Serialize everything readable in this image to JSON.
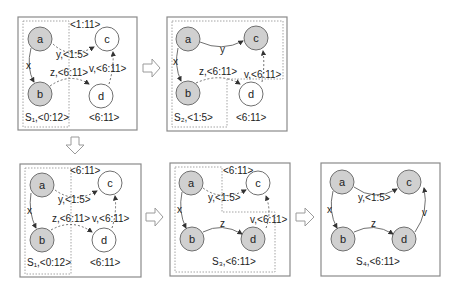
{
  "panels": [
    {
      "id": "p1",
      "set_label": "S₁,<0:12>",
      "nodes": {
        "a": "a",
        "b": "b",
        "c": "c",
        "d": "d"
      },
      "edges": {
        "x": "x",
        "y": "y,<1:5>",
        "z": "z,<6:11>",
        "v": "v,<6:11>"
      },
      "c_interval": "<1:11>",
      "d_interval": "<6:11>"
    },
    {
      "id": "p2",
      "set_label": "S₂,<1:5>",
      "nodes": {
        "a": "a",
        "b": "b",
        "c": "c",
        "d": "d"
      },
      "edges": {
        "x": "x",
        "y": "y",
        "z": "z,<6:11>",
        "v": "v,<6:11>"
      },
      "d_interval": "<6:11>"
    },
    {
      "id": "p3",
      "set_label": "S₁,<0:12>",
      "nodes": {
        "a": "a",
        "b": "b",
        "c": "c",
        "d": "d"
      },
      "edges": {
        "x": "x",
        "y": "y,<1:5>",
        "z": "z,<6:11>",
        "v": "v,<6:11>"
      },
      "c_interval": "<6:11>",
      "d_interval": "<6:11>"
    },
    {
      "id": "p4",
      "set_label": "S₃,<6:11>",
      "nodes": {
        "a": "a",
        "b": "b",
        "c": "c",
        "d": "d"
      },
      "edges": {
        "x": "x",
        "y": "y,<1:5>",
        "z": "z",
        "v": "v,<6:11>"
      },
      "c_interval": "<6:11>"
    },
    {
      "id": "p5",
      "set_label": "S₄,<6:11>",
      "nodes": {
        "a": "a",
        "b": "b",
        "c": "c",
        "d": "d"
      },
      "edges": {
        "x": "x",
        "y": "y,<1:5>",
        "z": "z",
        "v": "v"
      }
    }
  ],
  "arrows": [
    "right",
    "down",
    "right",
    "right"
  ]
}
